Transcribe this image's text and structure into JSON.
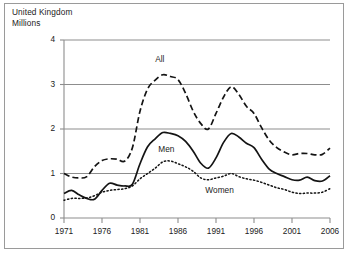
{
  "header": {
    "country": "United Kingdom",
    "units": "Millions"
  },
  "chart_data": {
    "type": "line",
    "title": "United Kingdom",
    "subtitle": "Millions",
    "xlabel": "",
    "ylabel": "Millions",
    "xlim": [
      1971,
      2006
    ],
    "ylim": [
      0,
      4
    ],
    "grid": true,
    "gridlines_y": [
      1,
      2,
      3,
      4
    ],
    "yticks": [
      "0",
      "1",
      "2",
      "3",
      "4"
    ],
    "ytick_values": [
      0,
      1,
      2,
      3,
      4
    ],
    "xticks": [
      "1971",
      "1976",
      "1981",
      "1986",
      "1991",
      "1996",
      "2001",
      "2006"
    ],
    "xtick_values": [
      1971,
      1976,
      1981,
      1986,
      1991,
      1996,
      2001,
      2006
    ],
    "legend_position": "inline-annotations",
    "annotations": [
      {
        "text": "All",
        "x": 1983.0,
        "y": 3.55
      },
      {
        "text": "Men",
        "x": 1983.4,
        "y": 1.52
      },
      {
        "text": "Women",
        "x": 1989.6,
        "y": 0.6
      }
    ],
    "x": [
      1971,
      1972,
      1973,
      1974,
      1975,
      1976,
      1977,
      1978,
      1979,
      1980,
      1981,
      1982,
      1983,
      1984,
      1985,
      1986,
      1987,
      1988,
      1989,
      1990,
      1991,
      1992,
      1993,
      1994,
      1995,
      1996,
      1997,
      1998,
      1999,
      2000,
      2001,
      2002,
      2003,
      2004,
      2005,
      2006
    ],
    "series": [
      {
        "name": "All",
        "style": "dashed",
        "color": "#141414",
        "values": [
          1.0,
          0.92,
          0.9,
          0.93,
          1.15,
          1.29,
          1.33,
          1.32,
          1.28,
          1.58,
          2.4,
          2.9,
          3.1,
          3.22,
          3.18,
          3.11,
          2.8,
          2.4,
          2.12,
          2.0,
          2.35,
          2.72,
          2.95,
          2.78,
          2.51,
          2.35,
          2.03,
          1.75,
          1.58,
          1.48,
          1.42,
          1.45,
          1.45,
          1.42,
          1.43,
          1.57
        ]
      },
      {
        "name": "Men",
        "style": "solid",
        "color": "#141414",
        "values": [
          0.55,
          0.62,
          0.52,
          0.44,
          0.42,
          0.62,
          0.78,
          0.74,
          0.72,
          0.76,
          1.22,
          1.6,
          1.78,
          1.92,
          1.9,
          1.85,
          1.72,
          1.5,
          1.23,
          1.12,
          1.35,
          1.7,
          1.9,
          1.82,
          1.68,
          1.58,
          1.32,
          1.1,
          1.0,
          0.93,
          0.86,
          0.85,
          0.92,
          0.84,
          0.83,
          0.95
        ]
      },
      {
        "name": "Women",
        "style": "dotted",
        "color": "#141414",
        "values": [
          0.4,
          0.44,
          0.44,
          0.45,
          0.5,
          0.58,
          0.62,
          0.64,
          0.66,
          0.72,
          0.88,
          1.0,
          1.12,
          1.26,
          1.28,
          1.22,
          1.15,
          1.05,
          0.9,
          0.86,
          0.9,
          0.94,
          1.0,
          0.93,
          0.88,
          0.85,
          0.8,
          0.74,
          0.68,
          0.64,
          0.58,
          0.55,
          0.56,
          0.56,
          0.58,
          0.66
        ]
      }
    ]
  }
}
